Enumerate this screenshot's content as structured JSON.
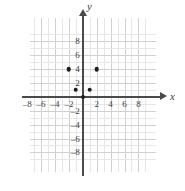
{
  "chart_data": {
    "type": "scatter",
    "title": "",
    "xlabel": "x",
    "ylabel": "y",
    "xlim": [
      -9.3,
      9.3
    ],
    "ylim": [
      -9.3,
      9.3
    ],
    "grid": true,
    "grid_step": 1,
    "major_grid_step": 2,
    "legend": "none",
    "x_ticks": [
      -8,
      -6,
      -4,
      -2,
      2,
      4,
      6,
      8
    ],
    "y_ticks": [
      8,
      6,
      4,
      2,
      -2,
      -4,
      -6,
      -8
    ],
    "x_tick_labels": [
      "–8",
      "–6",
      "–4",
      "–2",
      "2",
      "4",
      "6",
      "8"
    ],
    "y_tick_labels": [
      "8",
      "6",
      "4",
      "2",
      "–2",
      "–4",
      "–6",
      "–8"
    ],
    "points": [
      {
        "label": "point-1",
        "x": -2,
        "y": 4
      },
      {
        "label": "point-2",
        "x": 2,
        "y": 4
      },
      {
        "label": "point-3",
        "x": -1,
        "y": 1
      },
      {
        "label": "point-4",
        "x": 1,
        "y": 1
      }
    ],
    "point_color": "#1c1c1c",
    "axis_color": "#4a4a4a",
    "grid_color": "#e6e6e6",
    "major_grid_color": "#d0d0d0",
    "background": "#ffffff"
  },
  "axes": {
    "x_name": "x",
    "y_name": "y"
  }
}
